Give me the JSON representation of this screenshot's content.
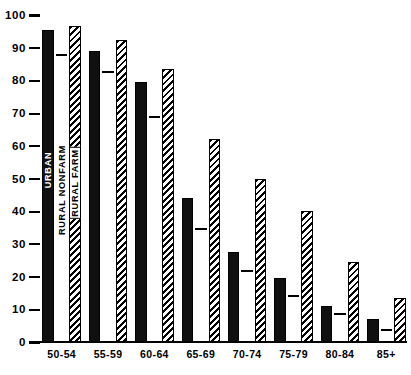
{
  "chart_data": {
    "type": "bar",
    "title": "",
    "subtitle": "",
    "xlabel": "",
    "ylabel": "",
    "ylim": [
      0,
      100
    ],
    "yticks": [
      0,
      10,
      20,
      30,
      40,
      50,
      60,
      70,
      80,
      90,
      100
    ],
    "ytick_labels": [
      "0",
      "10",
      "20",
      "30",
      "40",
      "50",
      "60",
      "70",
      "80",
      "90",
      "100"
    ],
    "grid": false,
    "legend_position": "inside-first-group",
    "categories": [
      "50-54",
      "55-59",
      "60-64",
      "65-69",
      "70-74",
      "75-79",
      "80-84",
      "85+"
    ],
    "series": [
      {
        "name": "URBAN",
        "style": "solid-black",
        "color": "#101010",
        "values": [
          95.5,
          89,
          79.5,
          44,
          27.5,
          19.5,
          11,
          7
        ]
      },
      {
        "name": "RURAL NONFARM",
        "style": "open-white",
        "color": "#ffffff",
        "values": [
          88,
          83,
          69,
          35,
          22,
          14.5,
          9,
          4
        ]
      },
      {
        "name": "RURAL FARM",
        "style": "diagonal-hatch",
        "color": "#000000",
        "values": [
          96.5,
          92.5,
          83.5,
          62,
          50,
          40,
          24.5,
          13.5
        ]
      }
    ]
  },
  "legend": {
    "urban": "URBAN",
    "rural_nonfarm": "RURAL NONFARM",
    "rural_farm": "RURAL FARM"
  }
}
